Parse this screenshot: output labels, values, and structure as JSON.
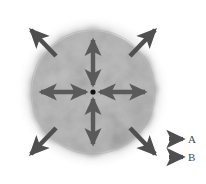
{
  "figure": {
    "title": "",
    "background_color": "#ffffff"
  },
  "cloud": {
    "name": "diffuse-sphere",
    "center_x": 93,
    "center_y": 92,
    "radius": 65,
    "fill_color": "#b4b4b4",
    "edge": "fuzzy"
  },
  "center_point": {
    "label": "",
    "x": 93,
    "y": 92,
    "radius": 2.6,
    "color": "#111111"
  },
  "arrows": {
    "type_a_color": "#5a5a5a",
    "type_b_color": "#4f4f4f",
    "type_a": [
      {
        "name": "arrow-a-up",
        "direction": "up",
        "double_headed": true
      },
      {
        "name": "arrow-a-down",
        "direction": "down",
        "double_headed": true
      },
      {
        "name": "arrow-a-left",
        "direction": "left",
        "double_headed": true
      },
      {
        "name": "arrow-a-right",
        "direction": "right",
        "double_headed": true
      }
    ],
    "type_b": [
      {
        "name": "arrow-b-upleft",
        "direction": "up-left",
        "double_headed": false
      },
      {
        "name": "arrow-b-upright",
        "direction": "up-right",
        "double_headed": false
      },
      {
        "name": "arrow-b-downleft",
        "direction": "down-left",
        "double_headed": false
      },
      {
        "name": "arrow-b-downright",
        "direction": "down-right",
        "double_headed": false
      }
    ]
  },
  "legend": {
    "items": [
      {
        "key": "A",
        "label": "A",
        "color": "#4f4f4f"
      },
      {
        "key": "B",
        "label": "B",
        "color": "#4f4f4f"
      }
    ]
  }
}
